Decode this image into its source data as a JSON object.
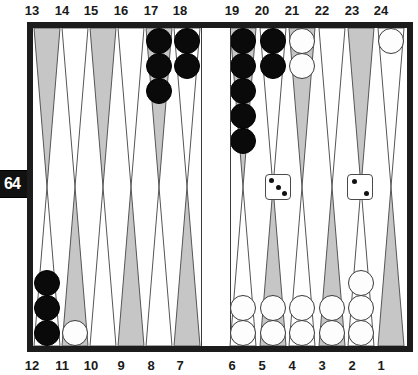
{
  "game": {
    "name": "backgammon-board",
    "board_colors": {
      "frame": "#1c1c1c",
      "surface": "#ffffff",
      "point_shaded": "#c9c9c9",
      "point_plain": "#ffffff",
      "checker_black": "#0a0a0a",
      "checker_white": "#fdfdfd"
    }
  },
  "labels": {
    "top": [
      "13",
      "14",
      "15",
      "16",
      "17",
      "18",
      "19",
      "20",
      "21",
      "22",
      "23",
      "24"
    ],
    "bottom": [
      "12",
      "11",
      "10",
      "9",
      "8",
      "7",
      "6",
      "5",
      "4",
      "3",
      "2",
      "1"
    ]
  },
  "doubling_cube": {
    "value": "64",
    "position": "left-edge"
  },
  "dice": [
    {
      "name": "die-left",
      "value": 3
    },
    {
      "name": "die-right",
      "value": 2
    }
  ],
  "points": [
    {
      "point": 13,
      "checkers": 0,
      "color": null,
      "shaded": true
    },
    {
      "point": 14,
      "checkers": 0,
      "color": null,
      "shaded": false
    },
    {
      "point": 15,
      "checkers": 0,
      "color": null,
      "shaded": true
    },
    {
      "point": 16,
      "checkers": 0,
      "color": null,
      "shaded": false
    },
    {
      "point": 17,
      "checkers": 3,
      "color": "black",
      "shaded": true
    },
    {
      "point": 18,
      "checkers": 2,
      "color": "black",
      "shaded": false
    },
    {
      "point": 19,
      "checkers": 5,
      "color": "black",
      "shaded": true
    },
    {
      "point": 20,
      "checkers": 2,
      "color": "black",
      "shaded": false
    },
    {
      "point": 21,
      "checkers": 2,
      "color": "white",
      "shaded": true
    },
    {
      "point": 22,
      "checkers": 0,
      "color": null,
      "shaded": false
    },
    {
      "point": 23,
      "checkers": 0,
      "color": null,
      "shaded": true
    },
    {
      "point": 24,
      "checkers": 1,
      "color": "white",
      "shaded": false
    },
    {
      "point": 12,
      "checkers": 3,
      "color": "black",
      "shaded": false
    },
    {
      "point": 11,
      "checkers": 1,
      "color": "white",
      "shaded": true
    },
    {
      "point": 10,
      "checkers": 0,
      "color": null,
      "shaded": false
    },
    {
      "point": 9,
      "checkers": 0,
      "color": null,
      "shaded": true
    },
    {
      "point": 8,
      "checkers": 0,
      "color": null,
      "shaded": false
    },
    {
      "point": 7,
      "checkers": 0,
      "color": null,
      "shaded": true
    },
    {
      "point": 6,
      "checkers": 2,
      "color": "white",
      "shaded": false
    },
    {
      "point": 5,
      "checkers": 2,
      "color": "white",
      "shaded": true
    },
    {
      "point": 4,
      "checkers": 2,
      "color": "white",
      "shaded": false
    },
    {
      "point": 3,
      "checkers": 2,
      "color": "white",
      "shaded": true
    },
    {
      "point": 2,
      "checkers": 3,
      "color": "white",
      "shaded": false
    },
    {
      "point": 1,
      "checkers": 0,
      "color": null,
      "shaded": true
    }
  ],
  "bar": {
    "black": 0,
    "white": 0
  }
}
